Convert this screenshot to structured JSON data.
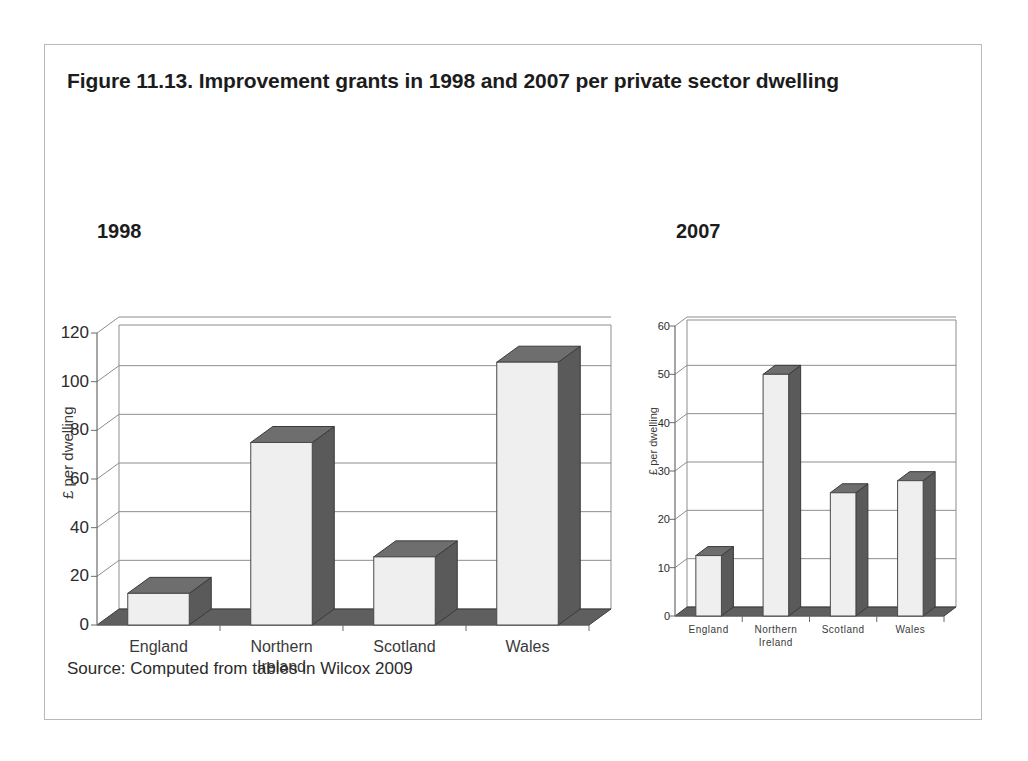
{
  "figure": {
    "title": "Figure 11.13. Improvement grants in 1998 and 2007 per private sector dwelling",
    "source": "Source: Computed from tables in Wilcox 2009"
  },
  "panels": [
    {
      "heading": "1998"
    },
    {
      "heading": "2007"
    }
  ],
  "chart_data": [
    {
      "type": "bar",
      "title": "1998",
      "categories": [
        "England",
        "Northern Ireland",
        "Scotland",
        "Wales"
      ],
      "values": [
        13,
        75,
        28,
        108
      ],
      "xlabel": "",
      "ylabel": "£ per dwelling",
      "ylim": [
        0,
        120
      ],
      "yticks": [
        0,
        20,
        40,
        60,
        80,
        100,
        120
      ],
      "ytick_labels": [
        "0",
        "20",
        "40",
        "60",
        "80",
        "100",
        "120"
      ],
      "grid": true,
      "legend": "none",
      "style": "3d-column"
    },
    {
      "type": "bar",
      "title": "2007",
      "categories": [
        "England",
        "Northern Ireland",
        "Scotland",
        "Wales"
      ],
      "values": [
        12.5,
        50,
        25.5,
        28
      ],
      "xlabel": "",
      "ylabel": "£ per dwelling",
      "ylim": [
        0,
        60
      ],
      "yticks": [
        0,
        10,
        20,
        30,
        40,
        50,
        60
      ],
      "ytick_labels": [
        "0",
        "10",
        "20",
        "30",
        "40",
        "50",
        "60"
      ],
      "grid": true,
      "legend": "none",
      "style": "3d-column"
    }
  ],
  "colors": {
    "bar_front": "#efefef",
    "bar_side": "#5a5a5a",
    "bar_top": "#6e6e6e",
    "grid": "#8d8d8d",
    "border": "#b9b9b9",
    "text": "#2b2b2b"
  }
}
